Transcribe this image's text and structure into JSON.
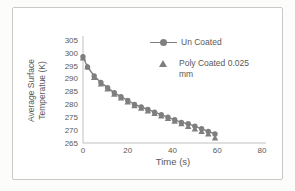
{
  "chart_data": {
    "type": "line",
    "title": "",
    "xlabel": "Time (s)",
    "ylabel": "Average Surface Temperatue (K)",
    "ylabel_lines": [
      "Average Surface",
      "Temperatue (K)"
    ],
    "xlim": [
      0,
      80
    ],
    "ylim": [
      265,
      305
    ],
    "x_ticks": [
      0,
      20,
      40,
      60,
      80
    ],
    "y_ticks": [
      265,
      270,
      275,
      280,
      285,
      290,
      295,
      300,
      305
    ],
    "grid": false,
    "legend_position": "inside-top-right",
    "colors": {
      "series": "#7f7f7f",
      "text": "#595959",
      "axis": "#bfbfbf",
      "card_border": "#c9c9c9"
    },
    "series": [
      {
        "name": "Un Coated",
        "marker": "circle",
        "line": true,
        "x": [
          0,
          2,
          5,
          8,
          11,
          14,
          17,
          20,
          23,
          26,
          29,
          32,
          35,
          38,
          41,
          44,
          47,
          50,
          53,
          56,
          59
        ],
        "y": [
          298.5,
          294.5,
          291,
          288.5,
          286.5,
          284.5,
          283,
          281.5,
          280,
          279,
          278,
          277,
          276,
          275,
          274,
          273,
          272.5,
          271.5,
          270.5,
          269.5,
          268.5
        ]
      },
      {
        "name": "Poly Coated 0.025 mm",
        "marker": "triangle",
        "line": false,
        "x": [
          0,
          2,
          5,
          8,
          11,
          14,
          17,
          20,
          23,
          26,
          29,
          32,
          35,
          38,
          41,
          44,
          47,
          50,
          53,
          56,
          59
        ],
        "y": [
          298,
          294.5,
          290.5,
          288,
          286,
          284,
          282.5,
          281,
          279.5,
          278.5,
          277.5,
          276.5,
          275.5,
          274.5,
          273.5,
          272.5,
          271.5,
          270.5,
          269.5,
          268.5,
          267
        ]
      }
    ]
  }
}
